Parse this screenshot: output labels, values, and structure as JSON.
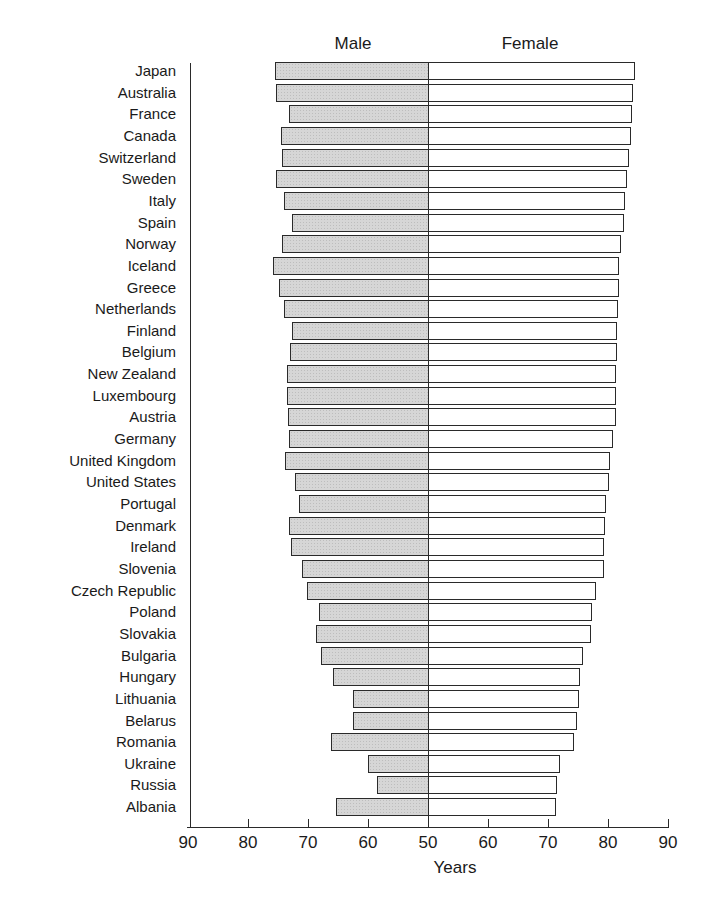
{
  "chart_data": {
    "type": "bar",
    "subtype": "back-to-back horizontal bar (population pyramid style)",
    "title": "",
    "series_titles": {
      "left": "Male",
      "right": "Female"
    },
    "xlabel": "Years",
    "ylabel": "",
    "xlim": [
      50,
      90
    ],
    "tick_labels_left": [
      "90",
      "80",
      "70",
      "60",
      "50"
    ],
    "tick_labels_right": [
      "60",
      "70",
      "80",
      "90"
    ],
    "tick_values": [
      90,
      80,
      70,
      60,
      50,
      60,
      70,
      80,
      90
    ],
    "grid": false,
    "legend": "none (series titles above bars)",
    "categories": [
      "Japan",
      "Australia",
      "France",
      "Canada",
      "Switzerland",
      "Sweden",
      "Italy",
      "Spain",
      "Norway",
      "Iceland",
      "Greece",
      "Netherlands",
      "Finland",
      "Belgium",
      "New Zealand",
      "Luxembourg",
      "Austria",
      "Germany",
      "United Kingdom",
      "United States",
      "Portugal",
      "Denmark",
      "Ireland",
      "Slovenia",
      "Czech Republic",
      "Poland",
      "Slovakia",
      "Bulgaria",
      "Hungary",
      "Lithuania",
      "Belarus",
      "Romania",
      "Ukraine",
      "Russia",
      "Albania"
    ],
    "series": [
      {
        "name": "Male",
        "color": "#d6d6d6",
        "values": [
          75.5,
          75.3,
          73.2,
          74.5,
          74.3,
          75.3,
          74.0,
          72.7,
          74.3,
          75.8,
          74.8,
          74.0,
          72.7,
          73.0,
          73.5,
          73.5,
          73.3,
          73.2,
          73.8,
          72.2,
          71.5,
          73.2,
          72.8,
          71.0,
          70.2,
          68.2,
          68.7,
          67.8,
          65.8,
          62.5,
          62.5,
          66.2,
          60.0,
          58.5,
          65.3
        ]
      },
      {
        "name": "Female",
        "color": "#ffffff",
        "values": [
          84.5,
          84.2,
          84.0,
          83.8,
          83.5,
          83.2,
          82.8,
          82.7,
          82.2,
          81.8,
          81.8,
          81.7,
          81.5,
          81.5,
          81.4,
          81.3,
          81.3,
          80.8,
          80.4,
          80.2,
          79.6,
          79.5,
          79.4,
          79.3,
          78.0,
          77.3,
          77.2,
          75.8,
          75.3,
          75.2,
          74.8,
          74.3,
          72.0,
          71.5,
          71.3
        ]
      }
    ]
  }
}
